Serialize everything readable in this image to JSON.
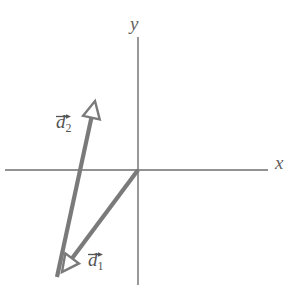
{
  "figure": {
    "background_color": "#ffffff",
    "width": 296,
    "height": 294
  },
  "axes": {
    "color": "#6e6e6e",
    "stroke_width": 1.4,
    "origin": {
      "x": 138,
      "y": 170
    },
    "x_axis": {
      "x1": 5,
      "y1": 170,
      "x2": 268,
      "y2": 170
    },
    "y_axis": {
      "x1": 138,
      "y1": 37,
      "x2": 138,
      "y2": 285
    },
    "x_label": "x",
    "y_label": "y"
  },
  "vectors": [
    {
      "id": "d1",
      "label_base": "d",
      "label_sub": "1",
      "color": "#7a7a7a",
      "stroke_width": 4.2,
      "tail": {
        "x": 138,
        "y": 170
      },
      "tip": {
        "x": 62,
        "y": 272
      },
      "arrowhead": "open-triangle",
      "label_position": {
        "x": 88,
        "y": 250
      }
    },
    {
      "id": "d2",
      "label_base": "d",
      "label_sub": "2",
      "color": "#7a7a7a",
      "stroke_width": 4.2,
      "tail": {
        "x": 57,
        "y": 277
      },
      "tip": {
        "x": 95,
        "y": 101
      },
      "arrowhead": "open-triangle",
      "label_position": {
        "x": 56,
        "y": 112
      }
    }
  ],
  "chart_data": {
    "type": "scatter",
    "title": "",
    "xlabel": "x",
    "ylabel": "y",
    "grid": false,
    "legend": "none",
    "annotations": [
      {
        "text": "d⃗1",
        "x": 88,
        "y": 250
      },
      {
        "text": "d⃗2",
        "x": 56,
        "y": 112
      }
    ],
    "series": [
      {
        "name": "d⃗1",
        "kind": "vector",
        "from": [
          0,
          0
        ],
        "to": [
          -76,
          -102
        ]
      },
      {
        "name": "d⃗2",
        "kind": "vector",
        "from": [
          -81,
          -107
        ],
        "to": [
          -43,
          69
        ]
      }
    ]
  }
}
